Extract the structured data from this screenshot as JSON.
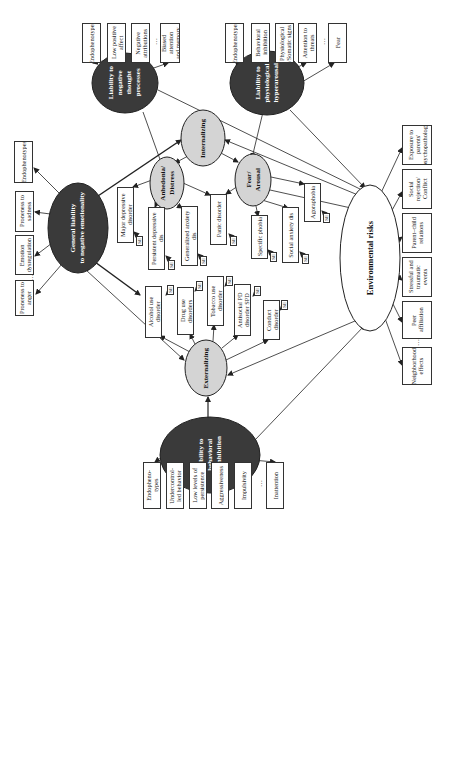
{
  "diagram": {
    "latent_factors": {
      "general": {
        "label": "General liability\nto negative emotionality"
      },
      "negative_thought": {
        "label": "Liability to\nnegative\nthought\nprocesses"
      },
      "hyperarousal": {
        "label": "Liability to\nphysiological\nhyperarousal"
      },
      "disinhibition": {
        "label": "Liability to\nbehavioral\ndisinhibition"
      }
    },
    "spectra": {
      "internalizing": {
        "label": "Internalizing"
      },
      "externalizing": {
        "label": "Externalizing"
      },
      "anhedonia": {
        "label": "Anhedonia/\nDistress"
      },
      "fear": {
        "label": "Fear/\nArousal"
      }
    },
    "environment": {
      "label": "Environmental risks"
    },
    "negative_thought_indicators": [
      "Endophenotypes",
      "Low positive\naffect",
      "Negative\nattributions",
      "Biased attention\nand memory"
    ],
    "hyperarousal_indicators": [
      "Endophenotypes",
      "Behavioral\ninhibition",
      "Physiological\n/Somatic signs",
      "Attention to\nthreats",
      "Fear"
    ],
    "general_indicators": [
      "Endophenotypes",
      "Proneness to\nsadness",
      "Emotion\ndysregulation",
      "Proneness to\nanger"
    ],
    "disinhibition_indicators": [
      "Endopheno-\ntypes",
      "Undercontrol-\nled behavior",
      "Low levels of\npersistence",
      "Aggressiveness",
      "Impulsivity",
      "Inattention"
    ],
    "distress_disorders": [
      "Major depressive disorder",
      "Persistent depressive dis",
      "Generalized anxiety dis"
    ],
    "fear_disorders": [
      "Panic disorder",
      "Specific phobia",
      "Social anxiety dis",
      "Agoraphobia"
    ],
    "externalizing_disorders": [
      "Alcohol use disorder",
      "Drug use disorders",
      "Tobacco use disorder",
      "Antisocial PD disorder SPD",
      "Conduct disorder"
    ],
    "environmental_factors": [
      "Exposure to\nparents'\npsychopathology",
      "Social rejection/\nConflict",
      "Parent–child\nrelations",
      "Stressful and\ntraumatic events",
      "Peer affiliation",
      "Neighborhood\neffects"
    ],
    "se_label": "SE",
    "ellipsis_vertical": "⋮",
    "ellipsis_horizontal": "…",
    "colors": {
      "dark_node": "#3a3a3a",
      "light_node": "#d4d4d4",
      "line": "#222222"
    }
  }
}
